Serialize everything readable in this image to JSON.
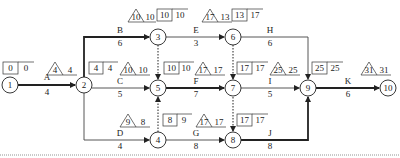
{
  "diagram": {
    "type": "activity-on-arrow network",
    "colors": {
      "line": "#333333",
      "text": "#222222",
      "background": "#ffffff"
    },
    "nodes": [
      {
        "id": "1",
        "x": 10,
        "y": 85
      },
      {
        "id": "2",
        "x": 84,
        "y": 85
      },
      {
        "id": "3",
        "x": 158,
        "y": 37
      },
      {
        "id": "4",
        "x": 158,
        "y": 140
      },
      {
        "id": "5",
        "x": 158,
        "y": 88
      },
      {
        "id": "6",
        "x": 233,
        "y": 37
      },
      {
        "id": "7",
        "x": 233,
        "y": 88
      },
      {
        "id": "8",
        "x": 233,
        "y": 140
      },
      {
        "id": "9",
        "x": 308,
        "y": 88
      },
      {
        "id": "10",
        "x": 388,
        "y": 88
      }
    ],
    "activities": [
      {
        "name": "A",
        "duration": "4",
        "from": "1",
        "to": "2",
        "critical": true
      },
      {
        "name": "B",
        "duration": "6",
        "from": "2",
        "to": "3",
        "critical": true
      },
      {
        "name": "C",
        "duration": "5",
        "from": "2",
        "to": "5",
        "critical": false
      },
      {
        "name": "D",
        "duration": "4",
        "from": "2",
        "to": "4",
        "critical": false
      },
      {
        "name": "E",
        "duration": "3",
        "from": "3",
        "to": "6",
        "critical": false
      },
      {
        "name": "F",
        "duration": "7",
        "from": "5",
        "to": "7",
        "critical": true
      },
      {
        "name": "G",
        "duration": "8",
        "from": "4",
        "to": "8",
        "critical": false
      },
      {
        "name": "H",
        "duration": "6",
        "from": "6",
        "to": "9",
        "critical": false
      },
      {
        "name": "I",
        "duration": "5",
        "from": "7",
        "to": "9",
        "critical": false
      },
      {
        "name": "J",
        "duration": "8",
        "from": "8",
        "to": "9",
        "critical": true
      },
      {
        "name": "K",
        "duration": "6",
        "from": "9",
        "to": "10",
        "critical": true
      }
    ],
    "dummies": [
      {
        "from": "3",
        "to": "5"
      },
      {
        "from": "4",
        "to": "5"
      },
      {
        "from": "6",
        "to": "7"
      },
      {
        "from": "7",
        "to": "8"
      }
    ],
    "node_times": {
      "1": {
        "box": [
          "0",
          "0"
        ]
      },
      "2": {
        "triangle": "4",
        "tri_side": "4",
        "box": [
          "4",
          "4"
        ]
      },
      "3": {
        "triangle": "10",
        "tri_side": "10",
        "box": [
          "10",
          "10"
        ]
      },
      "4": {
        "triangle": "9",
        "tri_side": "8",
        "box": [
          "8",
          "9"
        ]
      },
      "5": {
        "triangle": "10",
        "tri_side": "10",
        "box": [
          "10",
          "10"
        ]
      },
      "6": {
        "triangle": "17",
        "tri_side": "13",
        "box": [
          "13",
          "17"
        ]
      },
      "7": {
        "triangle": "17",
        "tri_side": "17",
        "box": [
          "17",
          "17"
        ]
      },
      "8": {
        "triangle": "17",
        "tri_side": "17",
        "box": [
          "17",
          "17"
        ]
      },
      "9": {
        "triangle": "25",
        "tri_side": "25",
        "box": [
          "25",
          "25"
        ]
      },
      "10": {
        "triangle": "31",
        "tri_side": "31"
      }
    }
  }
}
